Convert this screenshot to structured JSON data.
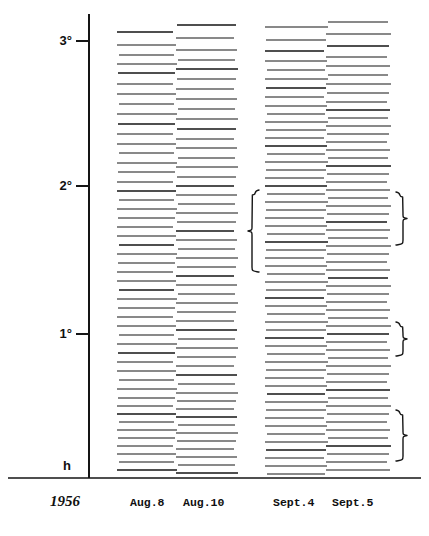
{
  "figure": {
    "axis": {
      "label_unit": "degrees",
      "ticks": [
        {
          "label": "3°",
          "value": 3.0,
          "y": 41
        },
        {
          "label": "2°",
          "value": 2.0,
          "y": 186
        },
        {
          "label": "1°",
          "value": 1.0,
          "y": 334
        }
      ],
      "origin_label": "h",
      "origin_y": 465,
      "axis_x": 89,
      "axis_top": 14,
      "axis_bottom": 478
    },
    "baseline_y": 478,
    "caption": {
      "year": "1956",
      "year_x": 50,
      "columns": [
        {
          "label": "Aug.8",
          "x": 130
        },
        {
          "label": "Aug.10",
          "x": 183
        },
        {
          "label": "Sept.4",
          "x": 273
        },
        {
          "label": "Sept.5",
          "x": 332
        }
      ],
      "y": 506
    },
    "colors": {
      "ink": "#151515",
      "paper": "#ffffff",
      "faint": "#4a4a4a"
    }
  },
  "chart_data": {
    "type": "line",
    "title": "",
    "xlabel": "",
    "ylabel": "",
    "ylim": [
      0,
      3.25
    ],
    "grid": false,
    "legend_position": "bottom",
    "columns": [
      {
        "name": "Aug.8",
        "x_start": 117,
        "x_end": 175,
        "lines": [
          {
            "y": 32,
            "w": 1.3
          },
          {
            "y": 45,
            "w": 1.0
          },
          {
            "y": 55,
            "w": 1.2
          },
          {
            "y": 64,
            "w": 1.0
          },
          {
            "y": 73,
            "w": 1.3
          },
          {
            "y": 84,
            "w": 1.0
          },
          {
            "y": 94,
            "w": 1.2
          },
          {
            "y": 104,
            "w": 1.0
          },
          {
            "y": 114,
            "w": 1.1
          },
          {
            "y": 124,
            "w": 1.3
          },
          {
            "y": 134,
            "w": 1.0
          },
          {
            "y": 144,
            "w": 1.1
          },
          {
            "y": 153,
            "w": 1.2
          },
          {
            "y": 163,
            "w": 1.0
          },
          {
            "y": 172,
            "w": 1.2
          },
          {
            "y": 182,
            "w": 1.1
          },
          {
            "y": 191,
            "w": 1.3
          },
          {
            "y": 200,
            "w": 1.0
          },
          {
            "y": 209,
            "w": 1.2
          },
          {
            "y": 218,
            "w": 1.0
          },
          {
            "y": 227,
            "w": 1.2
          },
          {
            "y": 236,
            "w": 1.1
          },
          {
            "y": 245,
            "w": 1.3
          },
          {
            "y": 254,
            "w": 1.0
          },
          {
            "y": 263,
            "w": 1.1
          },
          {
            "y": 272,
            "w": 1.2
          },
          {
            "y": 281,
            "w": 1.0
          },
          {
            "y": 290,
            "w": 1.3
          },
          {
            "y": 299,
            "w": 1.1
          },
          {
            "y": 308,
            "w": 1.0
          },
          {
            "y": 317,
            "w": 1.2
          },
          {
            "y": 326,
            "w": 1.0
          },
          {
            "y": 335,
            "w": 1.2
          },
          {
            "y": 344,
            "w": 1.1
          },
          {
            "y": 353,
            "w": 1.3
          },
          {
            "y": 362,
            "w": 1.0
          },
          {
            "y": 371,
            "w": 1.1
          },
          {
            "y": 380,
            "w": 1.2
          },
          {
            "y": 389,
            "w": 1.0
          },
          {
            "y": 398,
            "w": 1.2
          },
          {
            "y": 406,
            "w": 1.1
          },
          {
            "y": 414,
            "w": 1.3
          },
          {
            "y": 422,
            "w": 1.0
          },
          {
            "y": 430,
            "w": 1.2
          },
          {
            "y": 438,
            "w": 1.1
          },
          {
            "y": 446,
            "w": 1.0
          },
          {
            "y": 454,
            "w": 1.2
          },
          {
            "y": 462,
            "w": 1.1
          },
          {
            "y": 470,
            "w": 1.3
          }
        ]
      },
      {
        "name": "Aug.10",
        "x_start": 176,
        "x_end": 236,
        "lines": [
          {
            "y": 25,
            "w": 1.3
          },
          {
            "y": 38,
            "w": 1.1
          },
          {
            "y": 50,
            "w": 1.2
          },
          {
            "y": 60,
            "w": 1.0
          },
          {
            "y": 69,
            "w": 1.3
          },
          {
            "y": 79,
            "w": 1.1
          },
          {
            "y": 89,
            "w": 1.2
          },
          {
            "y": 99,
            "w": 1.0
          },
          {
            "y": 109,
            "w": 1.2
          },
          {
            "y": 119,
            "w": 1.1
          },
          {
            "y": 129,
            "w": 1.3
          },
          {
            "y": 139,
            "w": 1.0
          },
          {
            "y": 148,
            "w": 1.2
          },
          {
            "y": 158,
            "w": 1.1
          },
          {
            "y": 167,
            "w": 1.0
          },
          {
            "y": 177,
            "w": 1.2
          },
          {
            "y": 186,
            "w": 1.3
          },
          {
            "y": 195,
            "w": 1.0
          },
          {
            "y": 204,
            "w": 1.1
          },
          {
            "y": 213,
            "w": 1.2
          },
          {
            "y": 222,
            "w": 1.0
          },
          {
            "y": 231,
            "w": 1.3
          },
          {
            "y": 240,
            "w": 1.1
          },
          {
            "y": 249,
            "w": 1.0
          },
          {
            "y": 258,
            "w": 1.2
          },
          {
            "y": 267,
            "w": 1.1
          },
          {
            "y": 276,
            "w": 1.3
          },
          {
            "y": 285,
            "w": 1.0
          },
          {
            "y": 294,
            "w": 1.2
          },
          {
            "y": 303,
            "w": 1.1
          },
          {
            "y": 312,
            "w": 1.0
          },
          {
            "y": 321,
            "w": 1.2
          },
          {
            "y": 330,
            "w": 1.3
          },
          {
            "y": 339,
            "w": 1.0
          },
          {
            "y": 348,
            "w": 1.1
          },
          {
            "y": 357,
            "w": 1.2
          },
          {
            "y": 366,
            "w": 1.0
          },
          {
            "y": 375,
            "w": 1.3
          },
          {
            "y": 384,
            "w": 1.1
          },
          {
            "y": 393,
            "w": 1.0
          },
          {
            "y": 401,
            "w": 1.2
          },
          {
            "y": 409,
            "w": 1.1
          },
          {
            "y": 417,
            "w": 1.3
          },
          {
            "y": 425,
            "w": 1.0
          },
          {
            "y": 433,
            "w": 1.2
          },
          {
            "y": 441,
            "w": 1.1
          },
          {
            "y": 449,
            "w": 1.0
          },
          {
            "y": 457,
            "w": 1.2
          },
          {
            "y": 465,
            "w": 1.1
          },
          {
            "y": 473,
            "w": 1.3
          }
        ]
      },
      {
        "name": "Sept.4",
        "x_start": 265,
        "x_end": 326,
        "lines": [
          {
            "y": 27,
            "w": 1.2
          },
          {
            "y": 40,
            "w": 1.1
          },
          {
            "y": 51,
            "w": 1.3
          },
          {
            "y": 61,
            "w": 1.0
          },
          {
            "y": 70,
            "w": 1.2
          },
          {
            "y": 79,
            "w": 1.1
          },
          {
            "y": 88,
            "w": 1.3
          },
          {
            "y": 97,
            "w": 1.0
          },
          {
            "y": 106,
            "w": 1.2
          },
          {
            "y": 114,
            "w": 1.1
          },
          {
            "y": 122,
            "w": 1.0
          },
          {
            "y": 130,
            "w": 1.2
          },
          {
            "y": 138,
            "w": 1.1
          },
          {
            "y": 146,
            "w": 1.3
          },
          {
            "y": 154,
            "w": 1.0
          },
          {
            "y": 162,
            "w": 1.2
          },
          {
            "y": 170,
            "w": 1.1
          },
          {
            "y": 178,
            "w": 1.0
          },
          {
            "y": 186,
            "w": 1.3
          },
          {
            "y": 194,
            "w": 1.1
          },
          {
            "y": 202,
            "w": 1.2
          },
          {
            "y": 210,
            "w": 1.0
          },
          {
            "y": 218,
            "w": 1.1
          },
          {
            "y": 226,
            "w": 1.2
          },
          {
            "y": 234,
            "w": 1.0
          },
          {
            "y": 242,
            "w": 1.3
          },
          {
            "y": 250,
            "w": 1.1
          },
          {
            "y": 258,
            "w": 1.2
          },
          {
            "y": 266,
            "w": 1.0
          },
          {
            "y": 274,
            "w": 1.1
          },
          {
            "y": 282,
            "w": 1.2
          },
          {
            "y": 290,
            "w": 1.0
          },
          {
            "y": 298,
            "w": 1.3
          },
          {
            "y": 306,
            "w": 1.1
          },
          {
            "y": 314,
            "w": 1.2
          },
          {
            "y": 322,
            "w": 1.0
          },
          {
            "y": 330,
            "w": 1.1
          },
          {
            "y": 338,
            "w": 1.3
          },
          {
            "y": 346,
            "w": 1.0
          },
          {
            "y": 354,
            "w": 1.2
          },
          {
            "y": 362,
            "w": 1.1
          },
          {
            "y": 370,
            "w": 1.0
          },
          {
            "y": 378,
            "w": 1.2
          },
          {
            "y": 386,
            "w": 1.1
          },
          {
            "y": 394,
            "w": 1.3
          },
          {
            "y": 402,
            "w": 1.0
          },
          {
            "y": 410,
            "w": 1.2
          },
          {
            "y": 418,
            "w": 1.1
          },
          {
            "y": 426,
            "w": 1.0
          },
          {
            "y": 434,
            "w": 1.2
          },
          {
            "y": 442,
            "w": 1.1
          },
          {
            "y": 450,
            "w": 1.3
          },
          {
            "y": 458,
            "w": 1.0
          },
          {
            "y": 466,
            "w": 1.2
          },
          {
            "y": 474,
            "w": 1.1
          }
        ]
      },
      {
        "name": "Sept.5",
        "x_start": 326,
        "x_end": 389,
        "lines": [
          {
            "y": 22,
            "w": 1.2
          },
          {
            "y": 34,
            "w": 1.1
          },
          {
            "y": 46,
            "w": 1.3
          },
          {
            "y": 57,
            "w": 1.0
          },
          {
            "y": 66,
            "w": 1.2
          },
          {
            "y": 75,
            "w": 1.1
          },
          {
            "y": 84,
            "w": 1.0
          },
          {
            "y": 93,
            "w": 1.2
          },
          {
            "y": 102,
            "w": 1.1
          },
          {
            "y": 110,
            "w": 1.3
          },
          {
            "y": 118,
            "w": 1.0
          },
          {
            "y": 126,
            "w": 1.2
          },
          {
            "y": 134,
            "w": 1.1
          },
          {
            "y": 142,
            "w": 1.0
          },
          {
            "y": 150,
            "w": 1.2
          },
          {
            "y": 158,
            "w": 1.1
          },
          {
            "y": 166,
            "w": 1.3
          },
          {
            "y": 174,
            "w": 1.0
          },
          {
            "y": 182,
            "w": 1.2
          },
          {
            "y": 190,
            "w": 1.1
          },
          {
            "y": 198,
            "w": 1.0
          },
          {
            "y": 206,
            "w": 1.2
          },
          {
            "y": 214,
            "w": 1.1
          },
          {
            "y": 222,
            "w": 1.3
          },
          {
            "y": 230,
            "w": 1.0
          },
          {
            "y": 238,
            "w": 1.2
          },
          {
            "y": 246,
            "w": 1.1
          },
          {
            "y": 254,
            "w": 1.0
          },
          {
            "y": 262,
            "w": 1.2
          },
          {
            "y": 270,
            "w": 1.1
          },
          {
            "y": 278,
            "w": 1.3
          },
          {
            "y": 286,
            "w": 1.0
          },
          {
            "y": 294,
            "w": 1.2
          },
          {
            "y": 302,
            "w": 1.1
          },
          {
            "y": 310,
            "w": 1.0
          },
          {
            "y": 318,
            "w": 1.2
          },
          {
            "y": 326,
            "w": 1.1
          },
          {
            "y": 334,
            "w": 1.3
          },
          {
            "y": 342,
            "w": 1.0
          },
          {
            "y": 350,
            "w": 1.2
          },
          {
            "y": 358,
            "w": 1.1
          },
          {
            "y": 366,
            "w": 1.0
          },
          {
            "y": 374,
            "w": 1.2
          },
          {
            "y": 382,
            "w": 1.1
          },
          {
            "y": 390,
            "w": 1.3
          },
          {
            "y": 398,
            "w": 1.0
          },
          {
            "y": 406,
            "w": 1.2
          },
          {
            "y": 414,
            "w": 1.1
          },
          {
            "y": 422,
            "w": 1.0
          },
          {
            "y": 430,
            "w": 1.2
          },
          {
            "y": 438,
            "w": 1.1
          },
          {
            "y": 446,
            "w": 1.3
          },
          {
            "y": 454,
            "w": 1.0
          },
          {
            "y": 462,
            "w": 1.2
          },
          {
            "y": 470,
            "w": 1.1
          }
        ]
      }
    ],
    "braces": [
      {
        "id": "brace-left-sept4",
        "side": "left",
        "x": 259,
        "y_top": 190,
        "y_bottom": 272
      },
      {
        "id": "brace-right-sept5-upper",
        "side": "right",
        "x": 396,
        "y_top": 192,
        "y_bottom": 245
      },
      {
        "id": "brace-right-sept5-middle",
        "side": "right",
        "x": 396,
        "y_top": 322,
        "y_bottom": 356
      },
      {
        "id": "brace-right-sept5-lower",
        "side": "right",
        "x": 396,
        "y_top": 410,
        "y_bottom": 461
      }
    ]
  }
}
